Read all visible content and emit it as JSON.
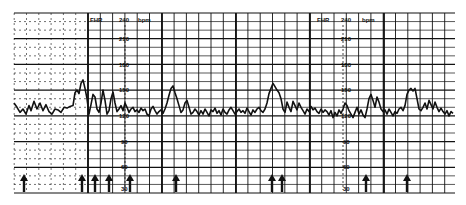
{
  "chart_data": {
    "type": "line",
    "ylabel": "FHR (bpm)",
    "y_unit_label": "bpm",
    "y_axis_name": "FHR",
    "ylim": [
      30,
      240
    ],
    "yticks": [
      240,
      210,
      180,
      150,
      120,
      90,
      60,
      30
    ],
    "grid": true,
    "legend": "none",
    "label_columns_x": [
      125,
      343
    ],
    "series": [
      {
        "name": "FHR",
        "x": [
          14,
          17,
          20,
          23,
          26,
          29,
          31,
          34,
          37,
          40,
          43,
          46,
          49,
          52,
          55,
          58,
          61,
          64,
          67,
          70,
          73,
          75,
          77,
          79,
          81,
          83,
          85,
          87,
          89,
          91,
          93,
          95,
          97,
          99,
          101,
          103,
          105,
          107,
          109,
          111,
          113,
          115,
          117,
          119,
          121,
          123,
          125,
          127,
          129,
          131,
          133,
          135,
          137,
          139,
          141,
          143,
          145,
          147,
          149,
          151,
          153,
          155,
          157,
          159,
          161,
          163,
          165,
          167,
          169,
          171,
          173,
          175,
          177,
          179,
          181,
          183,
          185,
          187,
          189,
          191,
          193,
          195,
          197,
          199,
          201,
          203,
          205,
          207,
          209,
          211,
          213,
          215,
          217,
          219,
          221,
          223,
          225,
          227,
          229,
          231,
          233,
          235,
          237,
          239,
          241,
          243,
          245,
          247,
          249,
          251,
          253,
          255,
          257,
          259,
          261,
          263,
          265,
          267,
          269,
          271,
          273,
          275,
          277,
          279,
          281,
          283,
          285,
          287,
          289,
          291,
          293,
          295,
          297,
          299,
          301,
          303,
          305,
          307,
          309,
          311,
          313,
          315,
          317,
          319,
          321,
          323,
          325,
          327,
          329,
          331,
          333,
          335,
          337,
          339,
          341,
          343,
          345,
          347,
          349,
          351,
          353,
          355,
          357,
          359,
          361,
          363,
          365,
          367,
          369,
          371,
          373,
          375,
          377,
          379,
          381,
          383,
          385,
          387,
          389,
          391,
          393,
          395,
          397,
          399,
          401,
          403,
          405,
          407,
          409,
          411,
          413,
          415,
          417,
          419,
          421,
          423,
          425,
          427,
          429,
          431,
          433,
          435,
          437,
          439,
          441,
          443,
          445,
          447,
          449,
          451,
          453,
          455
        ],
        "bpm": [
          135,
          130,
          124,
          128,
          122,
          132,
          126,
          137,
          128,
          135,
          126,
          133,
          125,
          122,
          128,
          127,
          124,
          130,
          129,
          131,
          132,
          147,
          150,
          146,
          158,
          162,
          152,
          140,
          122,
          133,
          145,
          142,
          128,
          124,
          135,
          150,
          138,
          122,
          126,
          140,
          148,
          135,
          125,
          128,
          132,
          126,
          135,
          130,
          124,
          128,
          130,
          125,
          127,
          124,
          129,
          126,
          128,
          122,
          120,
          128,
          131,
          126,
          122,
          125,
          127,
          123,
          128,
          135,
          144,
          152,
          155,
          147,
          140,
          132,
          124,
          127,
          135,
          138,
          130,
          122,
          124,
          128,
          125,
          121,
          126,
          122,
          128,
          124,
          120,
          127,
          125,
          129,
          123,
          126,
          121,
          128,
          124,
          122,
          127,
          130,
          126,
          122,
          125,
          128,
          124,
          126,
          123,
          129,
          125,
          121,
          127,
          124,
          128,
          130,
          126,
          124,
          128,
          135,
          146,
          152,
          158,
          154,
          150,
          147,
          140,
          128,
          124,
          136,
          130,
          125,
          137,
          132,
          127,
          135,
          130,
          126,
          122,
          128,
          125,
          131,
          127,
          129,
          125,
          123,
          128,
          124,
          127,
          125,
          121,
          126,
          118,
          124,
          120,
          127,
          123,
          128,
          135,
          132,
          126,
          122,
          118,
          124,
          130,
          122,
          127,
          121,
          118,
          128,
          140,
          145,
          138,
          130,
          142,
          136,
          128,
          125,
          127,
          122,
          128,
          124,
          120,
          125,
          123,
          128,
          130,
          126,
          132,
          145,
          150,
          152,
          149,
          152,
          140,
          128,
          126,
          130,
          135,
          128,
          138,
          133,
          128,
          136,
          130,
          125,
          129,
          125,
          122,
          126,
          120,
          125,
          123
        ]
      }
    ],
    "event_markers": {
      "name": "fetal movement arrows",
      "x": [
        24,
        82,
        95,
        109,
        130,
        176,
        272,
        282,
        366,
        407
      ]
    }
  },
  "labels": {
    "left_block": {
      "fhr": "FHR",
      "top": "240",
      "unit": "bpm",
      "v210": "210",
      "v180": "180",
      "v150": "150",
      "v120": "120",
      "v90": "90",
      "v60": "60",
      "v30": "30"
    },
    "right_block": {
      "fhr": "FHR",
      "top": "240",
      "unit": "bpm",
      "v210": "210",
      "v180": "180",
      "v150": "150",
      "v120": "120",
      "v90": "90",
      "v60": "60",
      "v30": "30"
    }
  },
  "colors": {
    "ink": "#111111",
    "grid_minor": "#333333",
    "paper": "#ffffff"
  }
}
